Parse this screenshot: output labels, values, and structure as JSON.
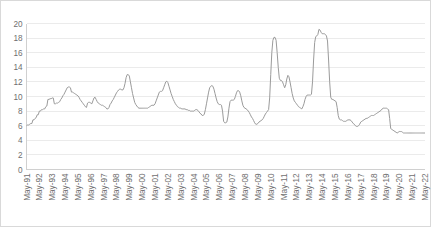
{
  "chart_data": {
    "type": "line",
    "title": "",
    "subtitle": "",
    "xlabel": "",
    "ylabel": "",
    "ylim": [
      0,
      20
    ],
    "ytick_step": 2,
    "yticks": [
      "0",
      "2",
      "4",
      "6",
      "8",
      "10",
      "12",
      "14",
      "16",
      "18",
      "20"
    ],
    "grid": "horizontal",
    "legend": "none",
    "line_color": "#9b9b9b",
    "plot_background": "#ffffff",
    "border_color": "#d9d9d9",
    "gridline_color": "#ebebeb",
    "x_tick_labels": [
      "May-91",
      "May-92",
      "May-93",
      "May-94",
      "May-95",
      "May-96",
      "May-97",
      "May-98",
      "May-99",
      "May-00",
      "May-01",
      "May-02",
      "May-03",
      "May-04",
      "May-05",
      "May-06",
      "May-07",
      "May-08",
      "May-09",
      "May-10",
      "May-11",
      "May-12",
      "May-13",
      "May-14",
      "May-15",
      "May-16",
      "May-17",
      "May-18",
      "May-19",
      "May-20",
      "May-21",
      "May-22"
    ],
    "x_start": "May-91",
    "x_end": "May-22",
    "x_interval": "monthly",
    "series": [
      {
        "name": "series-1",
        "values": [
          6.0,
          6.1,
          6.1,
          6.2,
          6.3,
          6.3,
          6.8,
          6.8,
          7.0,
          7.1,
          7.5,
          7.5,
          8.0,
          8.0,
          8.2,
          8.2,
          8.3,
          8.3,
          8.6,
          8.7,
          9.6,
          9.6,
          9.7,
          9.7,
          9.8,
          9.8,
          9.0,
          9.0,
          9.1,
          9.1,
          9.2,
          9.3,
          9.6,
          9.8,
          10.1,
          10.3,
          10.6,
          10.9,
          11.2,
          11.3,
          11.3,
          11.2,
          10.6,
          10.6,
          10.5,
          10.4,
          10.3,
          10.2,
          10.1,
          9.9,
          9.6,
          9.4,
          9.2,
          9.0,
          8.8,
          8.6,
          8.5,
          9.1,
          9.2,
          9.2,
          9.1,
          9.0,
          9.4,
          9.8,
          9.9,
          9.6,
          9.3,
          9.1,
          9.0,
          8.9,
          8.8,
          8.8,
          8.7,
          8.6,
          8.5,
          8.3,
          8.3,
          8.5,
          8.9,
          9.1,
          9.4,
          9.6,
          9.9,
          10.2,
          10.5,
          10.7,
          10.9,
          11.0,
          11.0,
          10.9,
          10.9,
          11.2,
          11.8,
          12.6,
          13.0,
          13.0,
          12.8,
          12.0,
          11.2,
          10.4,
          9.8,
          9.2,
          8.9,
          8.7,
          8.5,
          8.4,
          8.4,
          8.4,
          8.4,
          8.4,
          8.4,
          8.4,
          8.4,
          8.4,
          8.5,
          8.6,
          8.7,
          8.8,
          8.8,
          8.8,
          9.0,
          9.4,
          9.8,
          10.2,
          10.6,
          10.7,
          10.7,
          10.8,
          11.2,
          11.6,
          12.0,
          12.1,
          11.9,
          11.4,
          10.9,
          10.4,
          10.0,
          9.6,
          9.3,
          9.0,
          8.8,
          8.6,
          8.5,
          8.4,
          8.4,
          8.3,
          8.3,
          8.3,
          8.3,
          8.2,
          8.2,
          8.1,
          8.1,
          8.0,
          8.0,
          8.0,
          8.0,
          8.1,
          8.2,
          8.2,
          8.1,
          7.9,
          7.7,
          7.6,
          7.4,
          7.4,
          7.6,
          8.2,
          9.0,
          9.8,
          10.6,
          11.2,
          11.4,
          11.5,
          11.4,
          11.0,
          10.4,
          9.8,
          9.3,
          9.0,
          8.9,
          8.9,
          8.8,
          8.0,
          6.6,
          6.4,
          6.4,
          6.5,
          7.2,
          8.4,
          9.3,
          9.5,
          9.5,
          9.5,
          9.6,
          10.0,
          10.5,
          10.8,
          10.8,
          10.6,
          10.1,
          9.4,
          8.8,
          8.5,
          8.4,
          8.3,
          8.2,
          8.0,
          7.8,
          7.5,
          7.2,
          7.0,
          6.7,
          6.4,
          6.2,
          6.2,
          6.3,
          6.5,
          6.6,
          6.7,
          6.8,
          7.0,
          7.3,
          7.6,
          7.8,
          8.0,
          8.2,
          9.8,
          13.0,
          16.0,
          17.7,
          18.1,
          18.1,
          17.7,
          16.0,
          14.0,
          12.5,
          12.2,
          12.2,
          12.0,
          11.6,
          11.2,
          11.6,
          12.4,
          12.9,
          12.7,
          12.0,
          11.2,
          10.4,
          9.8,
          9.4,
          9.2,
          9.0,
          8.8,
          8.6,
          8.5,
          8.4,
          8.3,
          8.6,
          9.0,
          9.6,
          10.0,
          10.2,
          10.2,
          10.2,
          10.2,
          10.3,
          12.0,
          15.0,
          17.4,
          18.2,
          18.3,
          18.5,
          19.2,
          19.1,
          18.8,
          18.6,
          18.6,
          18.6,
          18.5,
          18.3,
          17.6,
          15.0,
          12.0,
          9.9,
          9.6,
          9.6,
          9.5,
          9.4,
          9.3,
          8.5,
          7.4,
          6.9,
          6.8,
          6.8,
          6.7,
          6.6,
          6.6,
          6.6,
          6.7,
          6.8,
          6.8,
          6.8,
          6.7,
          6.5,
          6.3,
          6.2,
          6.0,
          5.9,
          5.9,
          6.0,
          6.2,
          6.5,
          6.6,
          6.7,
          6.8,
          6.9,
          7.0,
          7.0,
          7.1,
          7.2,
          7.3,
          7.4,
          7.4,
          7.4,
          7.5,
          7.6,
          7.7,
          7.8,
          7.9,
          8.0,
          8.1,
          8.3,
          8.4,
          8.4,
          8.4,
          8.4,
          8.3,
          8.2,
          7.0,
          5.6,
          5.5,
          5.4,
          5.3,
          5.2,
          5.1,
          5.0,
          5.1,
          5.2,
          5.2,
          5.2,
          5.1,
          5.0,
          5.0,
          5.0,
          5.0,
          5.0,
          5.0,
          5.0,
          5.0,
          5.0,
          5.0,
          5.0,
          5.0,
          5.0,
          5.0,
          5.0,
          5.0,
          5.0,
          5.0,
          5.0,
          5.0,
          5.0
        ]
      }
    ]
  }
}
